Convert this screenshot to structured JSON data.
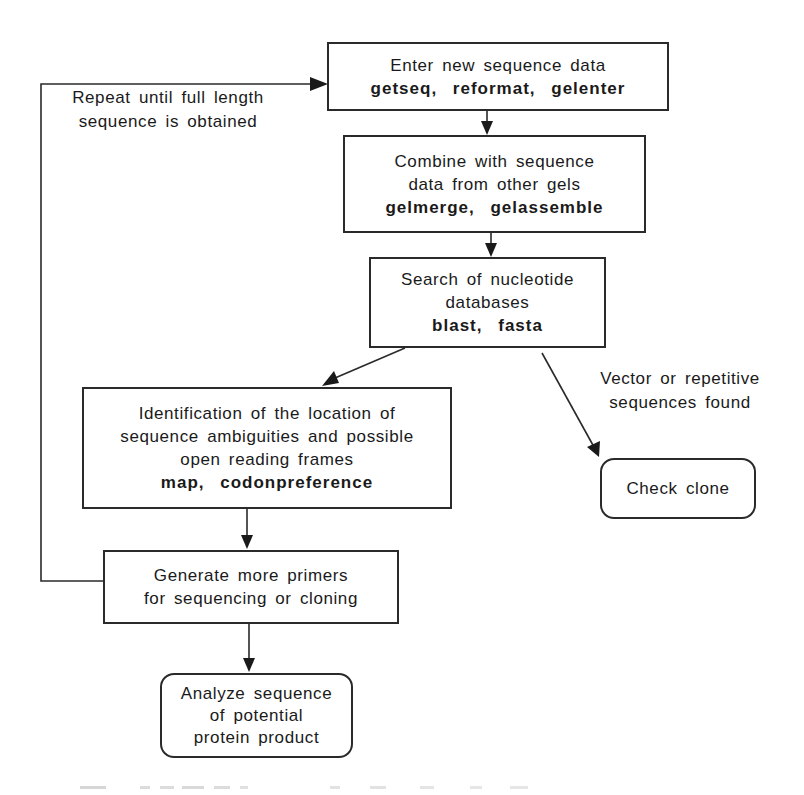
{
  "diagram": {
    "type": "flowchart",
    "nodes": {
      "enter": {
        "lines": [
          "Enter new sequence data"
        ],
        "commands": "getseq,  reformat,  gelenter"
      },
      "combine": {
        "lines": [
          "Combine with sequence",
          "data from other gels"
        ],
        "commands": "gelmerge,  gelassemble"
      },
      "search": {
        "lines": [
          "Search of nucleotide",
          "databases"
        ],
        "commands": "blast,  fasta"
      },
      "identify": {
        "lines": [
          "Identification of the location of",
          "sequence ambiguities and possible",
          "open reading frames"
        ],
        "commands": "map,  codonpreference"
      },
      "generate": {
        "lines": [
          "Generate more primers",
          "for sequencing or cloning"
        ]
      },
      "check_clone": {
        "lines": [
          "Check clone"
        ]
      },
      "analyze": {
        "lines": [
          "Analyze sequence",
          "of potential",
          "protein product"
        ]
      }
    },
    "edge_labels": {
      "repeat": [
        "Repeat until full length",
        "sequence is obtained"
      ],
      "vector": [
        "Vector or repetitive",
        "sequences found"
      ]
    },
    "edges": [
      {
        "from": "enter",
        "to": "combine"
      },
      {
        "from": "combine",
        "to": "search"
      },
      {
        "from": "search",
        "to": "identify"
      },
      {
        "from": "search",
        "to": "check_clone",
        "label": "vector"
      },
      {
        "from": "identify",
        "to": "generate"
      },
      {
        "from": "generate",
        "to": "analyze"
      },
      {
        "from": "generate",
        "to": "enter",
        "label": "repeat"
      }
    ],
    "colors": {
      "line": "#2a2a2a",
      "background": "#ffffff",
      "text": "#1a1a1a"
    }
  }
}
